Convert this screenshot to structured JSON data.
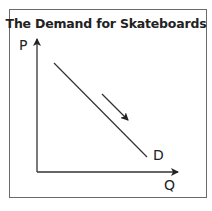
{
  "title": "The Demand for Skateboards",
  "axes": {
    "y_label": "P",
    "x_label": "Q"
  },
  "curve": {
    "label": "D",
    "color": "#333333"
  },
  "annotation": {
    "type": "arrow",
    "direction": "down-right along demand curve"
  }
}
